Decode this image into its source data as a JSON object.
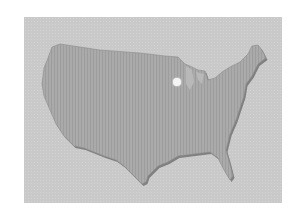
{
  "map": {
    "region": "contiguous-united-states",
    "style": "embossed-grayscale",
    "colors": {
      "background": "#ffffff",
      "frame": "#c9c9c9",
      "land": "#a9a9a9",
      "land_shadow": "#7f7f7f",
      "marker": "#f4f4f4"
    },
    "marker": {
      "x": 177,
      "y": 82
    }
  }
}
